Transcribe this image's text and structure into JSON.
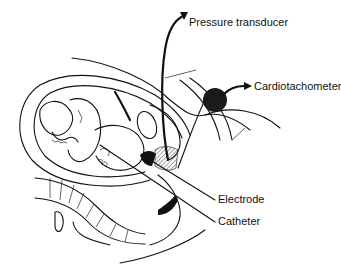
{
  "figure": {
    "labels": [
      {
        "id": "pressure-transducer",
        "text": "Pressure transducer"
      },
      {
        "id": "cardiotachometer",
        "text": "Cardiotachometer"
      },
      {
        "id": "electrode",
        "text": "Electrode"
      },
      {
        "id": "catheter",
        "text": "Catheter"
      }
    ]
  },
  "colors": {
    "ink": "#111111",
    "background": "#ffffff"
  }
}
